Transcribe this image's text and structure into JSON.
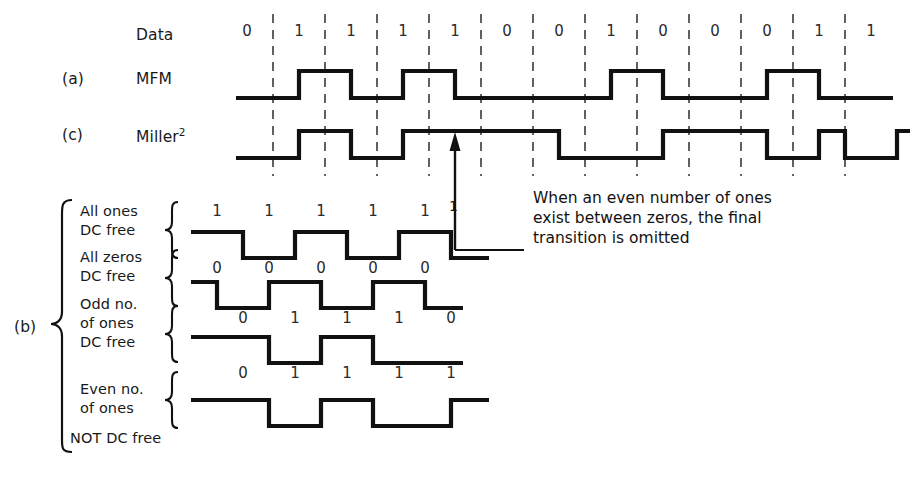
{
  "figure": {
    "title_rows": {
      "data_label": "Data",
      "a_tag": "(a)",
      "a_label": "MFM",
      "c_tag": "(c)",
      "c_label_base": "Miller",
      "c_label_sup": "2",
      "b_tag": "(b)"
    },
    "data_bits": [
      "0",
      "1",
      "1",
      "1",
      "1",
      "0",
      "0",
      "1",
      "0",
      "0",
      "0",
      "1",
      "1"
    ],
    "annotation": "When an even number of ones\nexist between zeros, the final\ntransition is omitted",
    "annotation_marker": "1"
  },
  "subrows": [
    {
      "name": "all-ones",
      "label_lines": [
        "All ones",
        "DC free"
      ],
      "top_bits": [
        "1",
        "1",
        "1",
        "1",
        "1"
      ],
      "bottom_bits": [
        "0",
        "0",
        "0",
        "0",
        "0"
      ]
    },
    {
      "name": "all-zeros",
      "label_lines": [
        "All zeros",
        "DC free"
      ],
      "top_bits": [],
      "bottom_bits": [
        "0",
        "1",
        "1",
        "1",
        "0"
      ]
    },
    {
      "name": "odd-no-of-ones",
      "label_lines": [
        "Odd no.",
        "of ones",
        "DC free"
      ],
      "top_bits": [],
      "bottom_bits": [
        "0",
        "1",
        "1",
        "1",
        "1"
      ]
    },
    {
      "name": "even-no-of-ones",
      "label_lines": [
        "Even no.",
        "of ones",
        "NOT DC free"
      ],
      "top_bits": [],
      "bottom_bits": []
    }
  ],
  "chart_data": {
    "type": "line",
    "xlabel": "",
    "ylabel": "",
    "grid": "dashed vertical cell boundaries",
    "legend": "none",
    "bit_cell_width_px": 52,
    "first_cell_center_px": 247,
    "categories": [
      "0",
      "1",
      "1",
      "1",
      "1",
      "0",
      "0",
      "1",
      "0",
      "0",
      "0",
      "1",
      "1"
    ],
    "series": [
      {
        "name": "MFM",
        "description": "Modified Frequency Modulation waveform (row a)",
        "levels": [
          0,
          1,
          0,
          1,
          0,
          0,
          1,
          0,
          0,
          1,
          0,
          1,
          0
        ]
      },
      {
        "name": "Miller squared",
        "description": "Miller-squared waveform (row c); final transition omitted when an even number of ones exists between zeros",
        "levels": [
          0,
          1,
          0,
          1,
          1,
          0,
          0,
          1,
          0,
          1,
          0,
          1,
          0
        ]
      },
      {
        "name": "All ones DC free",
        "description": "Sub-waveform b1: five ones, alternating, DC free",
        "levels": [
          1,
          0,
          1,
          0,
          1
        ]
      },
      {
        "name": "All zeros DC free",
        "description": "Sub-waveform b2: five zeros, DC free",
        "levels": [
          1,
          0,
          1,
          0,
          1
        ]
      },
      {
        "name": "Odd no. of ones DC free",
        "description": "Sub-waveform b3: bits 0 1 1 1 0, DC free",
        "levels": [
          1,
          0,
          1,
          0,
          0
        ]
      },
      {
        "name": "Even no. of ones NOT DC free",
        "description": "Sub-waveform b4: bits 0 1 1 1 1, not DC free",
        "levels": [
          1,
          0,
          1,
          0,
          1
        ]
      }
    ]
  }
}
